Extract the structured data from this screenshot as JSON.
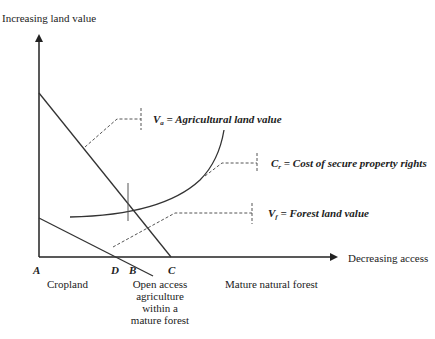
{
  "axes": {
    "y_label": "Increasing land value",
    "x_label": "Decreasing access"
  },
  "points": {
    "A": "A",
    "D": "D",
    "B": "B",
    "C": "C"
  },
  "curves": {
    "va": {
      "symbol": "V",
      "sub": "a",
      "text": " = Agricultural land value"
    },
    "cr": {
      "symbol": "C",
      "sub": "r",
      "text": " = Cost of secure property rights"
    },
    "vf": {
      "symbol": "V",
      "sub": "f",
      "text": " = Forest land value"
    }
  },
  "zones": {
    "cropland": "Cropland",
    "open_access": "Open access agriculture within a mature forest",
    "mature_forest": "Mature natural forest"
  },
  "colors": {
    "line": "#333333",
    "dashed": "#555555"
  }
}
